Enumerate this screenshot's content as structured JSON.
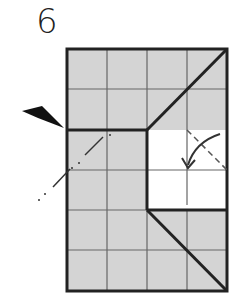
{
  "diagram": {
    "step_number": "6",
    "grid": {
      "cols": 4,
      "rows": 6,
      "fill": "#d4d4d4",
      "line_color": "#555555",
      "border_color": "#222222"
    },
    "blank_region": {
      "col_start": 2,
      "col_end": 4,
      "row_start": 2,
      "row_end": 4,
      "fill": "#ffffff"
    },
    "icons": [
      "pointer-arrow-icon",
      "fold-arrow-icon"
    ]
  }
}
